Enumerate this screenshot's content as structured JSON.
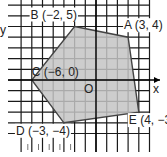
{
  "diagram": {
    "axis_labels": {
      "x": "x",
      "y": "y",
      "origin": "O"
    },
    "polygon_fill": "#c4c4c4",
    "polygon_stroke": "#444444",
    "grid_color": "#1a1a1a",
    "vertices": [
      {
        "name": "A",
        "x": 3,
        "y": 4,
        "label": "A (3, 4)"
      },
      {
        "name": "B",
        "x": -2,
        "y": 5,
        "label": "B (−2, 5)"
      },
      {
        "name": "C",
        "x": -6,
        "y": 0,
        "label": "C (−6, 0)"
      },
      {
        "name": "D",
        "x": -3,
        "y": -4,
        "label": "D (−3, −4)"
      },
      {
        "name": "E",
        "x": 4,
        "y": -3,
        "label": "E (4, −3)"
      }
    ],
    "polygon_order": [
      "B",
      "A",
      "E",
      "D",
      "C"
    ]
  }
}
